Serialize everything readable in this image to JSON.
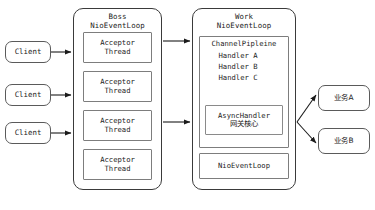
{
  "diagram": {
    "caption": "",
    "colors": {
      "background": "#ffffff",
      "panel_border": "#3a3a3a",
      "box_border": "#7d7d7d",
      "pill_border": "#5a5a5a",
      "arrow": "#1b1b1b",
      "text": "#1b1b1b"
    }
  },
  "clients": [
    {
      "label": "Client"
    },
    {
      "label": "Client"
    },
    {
      "label": "Client"
    }
  ],
  "boss_panel": {
    "title_line1": "Boss",
    "title_line2": "NioEventLoop",
    "threads": [
      {
        "line1": "Acceptor",
        "line2": "Thread"
      },
      {
        "line1": "Acceptor",
        "line2": "Thread"
      },
      {
        "line1": "Acceptor",
        "line2": "Thread"
      },
      {
        "line1": "Acceptor",
        "line2": "Thread"
      }
    ]
  },
  "work_panel": {
    "title_line1": "Work",
    "title_line2": "NioEventLoop",
    "pipeline": {
      "title": "ChannelPipleine",
      "handlers": [
        {
          "label": "Handler A"
        },
        {
          "label": "Handler B"
        },
        {
          "label": "Handler C"
        }
      ],
      "async_handler": {
        "line1": "AsyncHandler",
        "line2": "网关核心"
      }
    },
    "event_loop": {
      "label": "NioEventLoop"
    }
  },
  "services": [
    {
      "label": "业务A"
    },
    {
      "label": "业务B"
    }
  ]
}
